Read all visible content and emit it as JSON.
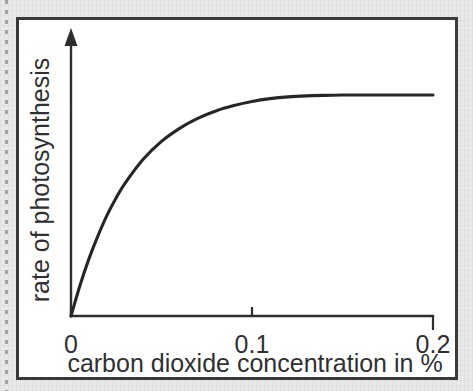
{
  "figure": {
    "frame_color": "#3a3a3c",
    "paper_color": "#ffffff",
    "page_background": "#e8e8e8",
    "ink_color": "#262628"
  },
  "chart_data": {
    "type": "line",
    "title": "",
    "subtitle": "",
    "xlabel": "carbon dioxide concentration in %",
    "ylabel": "rate of photosynthesis",
    "xlim": [
      0,
      0.2
    ],
    "ylim": [
      0,
      1
    ],
    "grid": false,
    "legend": null,
    "x_tick_labels": [
      "0",
      "0.1",
      "0.2"
    ],
    "x_ticks": [
      0,
      0.1,
      0.2
    ],
    "y_tick_labels": [],
    "y_ticks": [],
    "y_axis_arrow": true,
    "annotations": [],
    "series": [
      {
        "name": "rate of photosynthesis",
        "color": "#262628",
        "shape": "saturating-curve",
        "plateau_value": 0.86,
        "saturation_x": 0.135,
        "x": [
          0,
          0.005,
          0.01,
          0.015,
          0.02,
          0.025,
          0.03,
          0.04,
          0.05,
          0.06,
          0.07,
          0.08,
          0.09,
          0.1,
          0.11,
          0.12,
          0.13,
          0.14,
          0.15,
          0.16,
          0.17,
          0.18,
          0.19,
          0.2
        ],
        "y": [
          0,
          0.12,
          0.225,
          0.315,
          0.395,
          0.462,
          0.52,
          0.613,
          0.682,
          0.733,
          0.772,
          0.801,
          0.822,
          0.838,
          0.849,
          0.856,
          0.86,
          0.862,
          0.863,
          0.863,
          0.863,
          0.863,
          0.863,
          0.863
        ]
      }
    ]
  },
  "labels": {
    "x_axis_title": "carbon dioxide concentration in %",
    "y_axis_title": "rate of photosynthesis",
    "tick_0": "0",
    "tick_1": "0.1",
    "tick_2": "0.2"
  }
}
